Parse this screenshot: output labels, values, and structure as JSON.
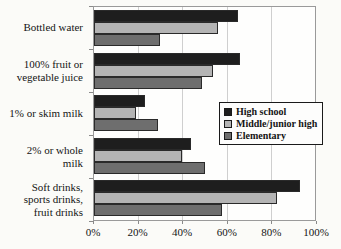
{
  "colors": {
    "background": "#fbfbf8",
    "plot_border": "#9a9a9a",
    "gridline": "#cfcfcf",
    "bar_border": "#2a2a2a",
    "text": "#141414",
    "legend_border": "#1a1a1a"
  },
  "chart_data": {
    "type": "bar",
    "orientation": "horizontal",
    "title": "",
    "xlabel": "",
    "ylabel": "",
    "xlim": [
      0,
      100
    ],
    "grid": true,
    "legend_position": "center-right",
    "x_ticks": [
      "0%",
      "20%",
      "40%",
      "60%",
      "80%",
      "100%"
    ],
    "categories": [
      "Bottled water",
      "100% fruit or vegetable juice",
      "1% or skim milk",
      "2% or whole milk",
      "Soft drinks, sports drinks, fruit drinks"
    ],
    "category_lines": [
      [
        "Bottled water"
      ],
      [
        "100% fruit or",
        "vegetable juice"
      ],
      [
        "1% or skim milk"
      ],
      [
        "2% or whole",
        "milk"
      ],
      [
        "Soft drinks,",
        "sports drinks,",
        "fruit drinks"
      ]
    ],
    "series": [
      {
        "name": "High school",
        "color": "#1e1e1e",
        "values": [
          65,
          66,
          23,
          44,
          93
        ]
      },
      {
        "name": "Middle/junior high",
        "color": "#b4b4b4",
        "values": [
          56,
          54,
          19,
          40,
          83
        ]
      },
      {
        "name": "Elementary",
        "color": "#6e6e6e",
        "values": [
          30,
          49,
          29,
          50,
          58
        ]
      }
    ]
  }
}
